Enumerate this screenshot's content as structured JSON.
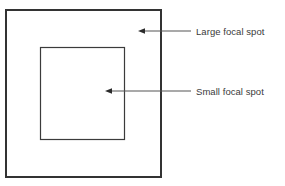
{
  "figure": {
    "title": "",
    "background_color": "#ffffff",
    "width": 285,
    "height": 186,
    "line_color": "#333333",
    "text_color": "#3a3a3a",
    "shapes": [
      {
        "name": "large-focal-spot-square",
        "label": "Large focal spot",
        "x": 5,
        "y": 9,
        "width": 157,
        "height": 169,
        "stroke_width": 2
      },
      {
        "name": "small-focal-spot-square",
        "label": "Small focal spot",
        "x": 40,
        "y": 47,
        "width": 85,
        "height": 93,
        "stroke_width": 1.2
      }
    ],
    "annotations": [
      {
        "name": "large-focal-spot-annotation",
        "label": "Large focal spot",
        "arrow_tip_x": 138,
        "arrow_tip_y": 31,
        "leader_end_x": 191,
        "leader_y": 31,
        "text_x": 196,
        "text_y": 26
      },
      {
        "name": "small-focal-spot-annotation",
        "label": "Small focal spot",
        "arrow_tip_x": 105,
        "arrow_tip_y": 91,
        "leader_end_x": 191,
        "leader_y": 91,
        "text_x": 196,
        "text_y": 86
      }
    ]
  }
}
